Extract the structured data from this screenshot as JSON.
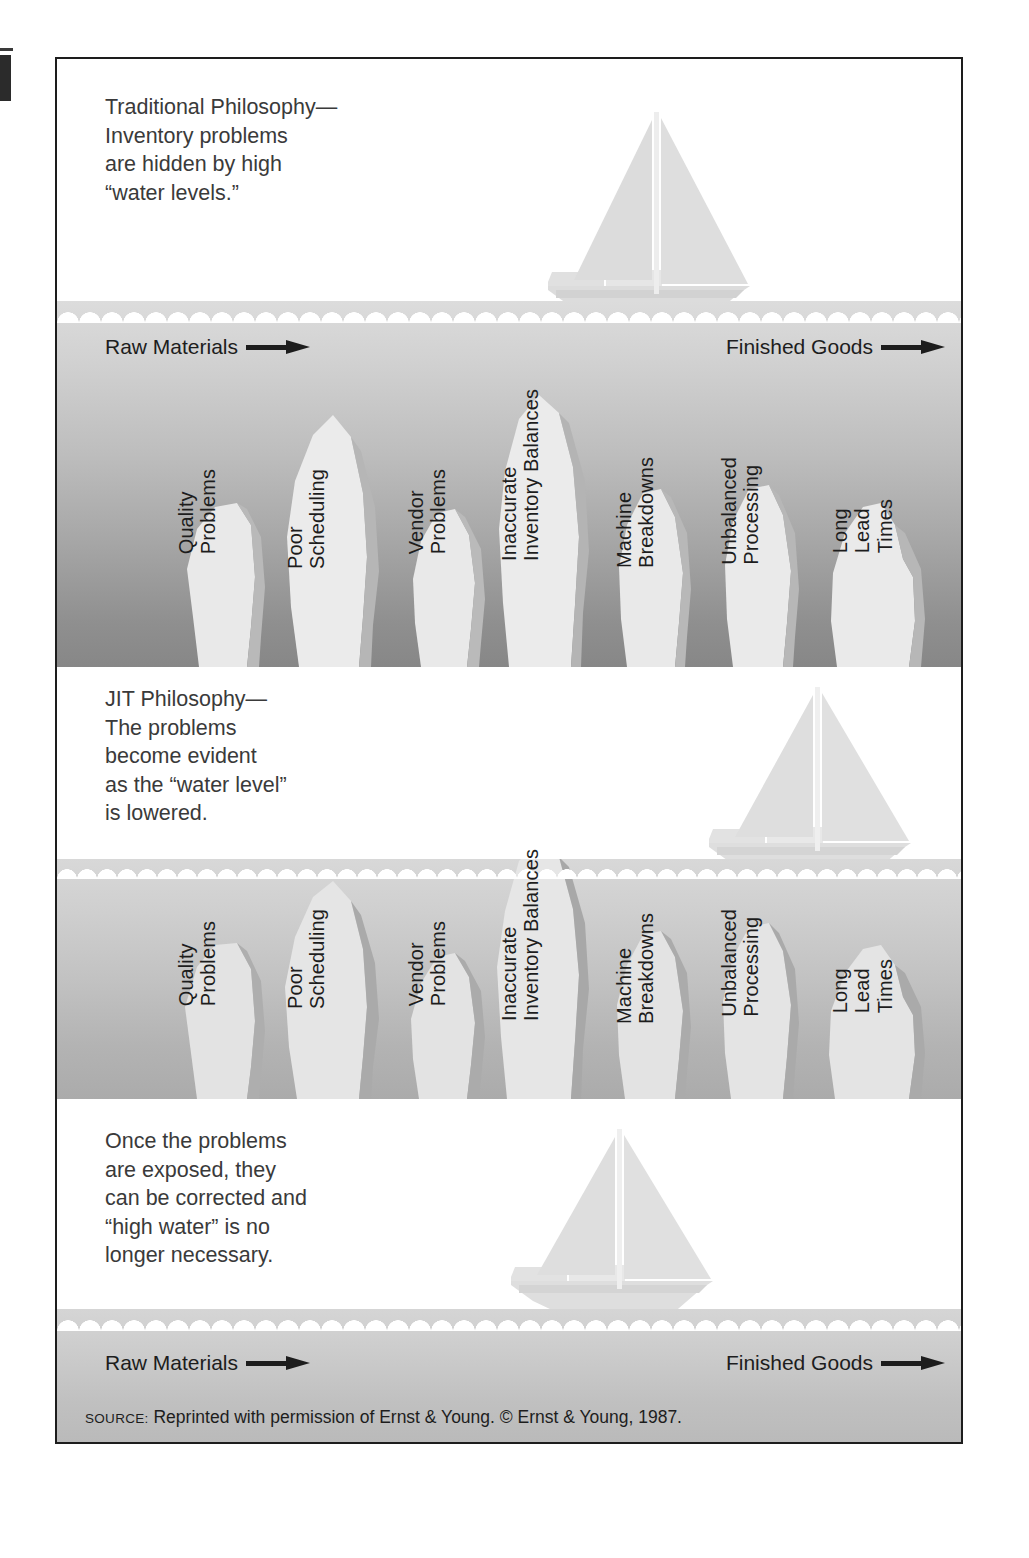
{
  "figure": {
    "source_prefix": "SOURCE:",
    "source_text": "Reprinted with permission of Ernst & Young. © Ernst & Young, 1987."
  },
  "colors": {
    "ink": "#1d1d1d",
    "caption_text": "#3a3a3a",
    "water_top": "#dcdcdc",
    "water_bottom": "#878787",
    "rock": "#e8e8e8",
    "rock_shadow": "#9a9a9a",
    "boat": "#e2e2e2",
    "page": "#ffffff"
  },
  "flow": {
    "raw_materials": "Raw Materials",
    "finished_goods": "Finished Goods",
    "arrow_icon": "arrow-right-icon"
  },
  "problems": [
    "Quality\nProblems",
    "Poor\nScheduling",
    "Vendor\nProblems",
    "Inaccurate\nInventory Balances",
    "Machine\nBreakdowns",
    "Unbalanced\nProcessing",
    "Long\nLead\nTimes"
  ],
  "panels": [
    {
      "id": "traditional",
      "caption": "Traditional Philosophy—\nInventory problems\nare hidden by high\n“water levels.”",
      "water_level": "high",
      "boat_position": "center",
      "boat_icon": "sailboat-icon",
      "shows_flow_labels": true,
      "shows_problem_labels": true
    },
    {
      "id": "jit",
      "caption": "JIT Philosophy—\nThe problems\nbecome evident\nas the “water level”\nis lowered.",
      "water_level": "lowered",
      "boat_position": "right",
      "boat_icon": "sailboat-icon",
      "shows_flow_labels": false,
      "shows_problem_labels": true
    },
    {
      "id": "corrected",
      "caption": "Once the problems\nare exposed, they\ncan be corrected and\n“high water” is no\nlonger necessary.",
      "water_level": "low-smooth",
      "boat_position": "center",
      "boat_icon": "sailboat-icon",
      "shows_flow_labels": true,
      "shows_problem_labels": false
    }
  ]
}
